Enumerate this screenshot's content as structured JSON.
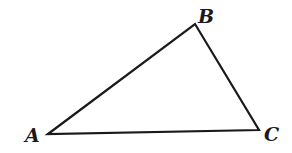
{
  "diagram": {
    "type": "triangle",
    "stroke_color": "#1a1a1a",
    "fill_color": "none",
    "vertices": [
      {
        "name": "A",
        "x": 48,
        "y": 134
      },
      {
        "name": "B",
        "x": 195,
        "y": 24
      },
      {
        "name": "C",
        "x": 259,
        "y": 130
      }
    ],
    "labels": {
      "a": "A",
      "b": "B",
      "c": "C"
    }
  }
}
